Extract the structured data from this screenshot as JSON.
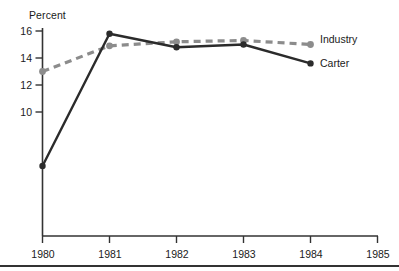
{
  "chart_data": {
    "type": "line",
    "title": "",
    "xlabel": "",
    "ylabel": "Percent",
    "x": [
      1980,
      1981,
      1982,
      1983,
      1984
    ],
    "xticks": [
      "1980",
      "1981",
      "1982",
      "1983",
      "1984",
      "1985"
    ],
    "xlim": [
      1980,
      1985
    ],
    "yticks": [
      "10",
      "12",
      "14",
      "16"
    ],
    "ylim": [
      4.2,
      16.8
    ],
    "grid": false,
    "legend_position": "right-inline",
    "series": [
      {
        "name": "Industry",
        "values": [
          13.0,
          14.9,
          15.2,
          15.3,
          15.0
        ],
        "style": "dashed",
        "color": "#8c8c8c"
      },
      {
        "name": "Carter",
        "values": [
          6.0,
          15.8,
          14.8,
          15.0,
          13.6
        ],
        "style": "solid",
        "color": "#2b2b2b"
      }
    ]
  },
  "axis": {
    "y_title": "Percent",
    "y_tick_16": "16",
    "y_tick_14": "14",
    "y_tick_12": "12",
    "y_tick_10": "10",
    "x_tick_1980": "1980",
    "x_tick_1981": "1981",
    "x_tick_1982": "1982",
    "x_tick_1983": "1983",
    "x_tick_1984": "1984",
    "x_tick_1985": "1985"
  },
  "legend": {
    "industry_label": "Industry",
    "carter_label": "Carter"
  },
  "colors": {
    "industry": "#8c8c8c",
    "carter": "#2b2b2b",
    "axis": "#333333",
    "rule": "#333333"
  }
}
